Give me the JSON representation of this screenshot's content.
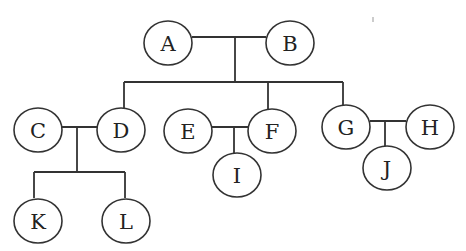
{
  "diagram": {
    "type": "family-tree",
    "nodes": [
      {
        "id": "A",
        "label": "A",
        "x": 168,
        "y": 43
      },
      {
        "id": "B",
        "label": "B",
        "x": 290,
        "y": 43
      },
      {
        "id": "C",
        "label": "C",
        "x": 38,
        "y": 130
      },
      {
        "id": "D",
        "label": "D",
        "x": 121,
        "y": 130
      },
      {
        "id": "E",
        "label": "E",
        "x": 188,
        "y": 131
      },
      {
        "id": "F",
        "label": "F",
        "x": 272,
        "y": 131
      },
      {
        "id": "G",
        "label": "G",
        "x": 346,
        "y": 127
      },
      {
        "id": "H",
        "label": "H",
        "x": 430,
        "y": 127
      },
      {
        "id": "I",
        "label": "I",
        "x": 237,
        "y": 175
      },
      {
        "id": "J",
        "label": "J",
        "x": 387,
        "y": 168
      },
      {
        "id": "K",
        "label": "K",
        "x": 38,
        "y": 221
      },
      {
        "id": "L",
        "label": "L",
        "x": 126,
        "y": 221
      }
    ],
    "couples": [
      {
        "partners": [
          "A",
          "B"
        ],
        "children": [
          "D",
          "F",
          "G"
        ]
      },
      {
        "partners": [
          "C",
          "D"
        ],
        "children": [
          "K",
          "L"
        ]
      },
      {
        "partners": [
          "E",
          "F"
        ],
        "children": [
          "I"
        ]
      },
      {
        "partners": [
          "G",
          "H"
        ],
        "children": [
          "J"
        ]
      }
    ]
  }
}
